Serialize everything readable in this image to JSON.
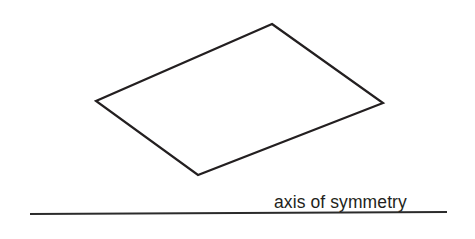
{
  "figure": {
    "background_color": "#ffffff",
    "width": 475,
    "height": 239,
    "stroke_color": "#231f20",
    "stroke_width": 2.2
  },
  "shape": {
    "name": "parallelogram",
    "fill": "#ffffff",
    "vertices": [
      {
        "label": "top",
        "x": 272,
        "y": 24
      },
      {
        "label": "right",
        "x": 383,
        "y": 103
      },
      {
        "label": "bottom",
        "x": 198,
        "y": 175
      },
      {
        "label": "left",
        "x": 96,
        "y": 101
      }
    ],
    "points_attr": "272,24 383,103 198,175 96,101"
  },
  "axis": {
    "label": "axis of symmetry",
    "color": "#2b2b2b",
    "stroke_width": 2.2,
    "x1": 30,
    "y1": 214,
    "x2": 447,
    "y2": 212
  }
}
